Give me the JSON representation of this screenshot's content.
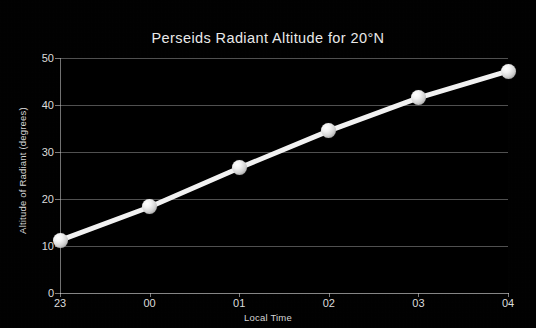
{
  "chart_data": {
    "type": "line",
    "title": "Perseids Radiant Altitude for 20°N",
    "xlabel": "Local Time",
    "ylabel": "Altitude of Radiant (degrees)",
    "categories": [
      "23",
      "00",
      "01",
      "02",
      "03",
      "04"
    ],
    "values": [
      11.2,
      18.3,
      26.6,
      34.5,
      41.5,
      47.2
    ],
    "ylim": [
      0,
      50
    ],
    "yticks": [
      "0",
      "10",
      "20",
      "30",
      "40",
      "50"
    ],
    "ytick_values": [
      0,
      10,
      20,
      30,
      40,
      50
    ],
    "xticks": [
      "23",
      "00",
      "01",
      "02",
      "03",
      "04"
    ],
    "grid": true,
    "legend": "none",
    "series": [
      {
        "name": "Radiant altitude",
        "values": [
          11.2,
          18.3,
          26.6,
          34.5,
          41.5,
          47.2
        ]
      }
    ],
    "colors": {
      "background": "#000000",
      "line": "#f2f2f2",
      "marker": "#ffffff",
      "grid": "#bebebe",
      "text": "#e0e0e0"
    }
  }
}
